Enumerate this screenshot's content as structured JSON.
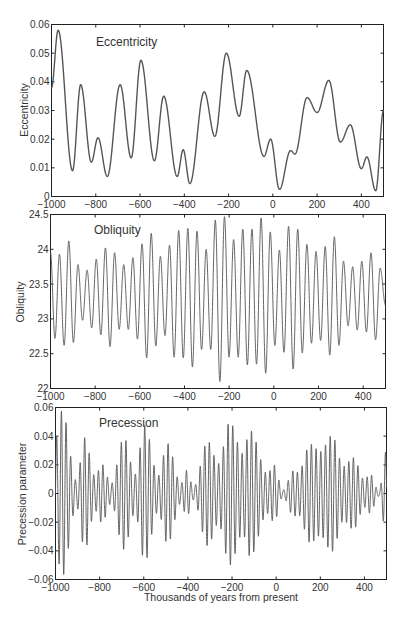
{
  "figure": {
    "xlabel": "Thousands of years from present",
    "caption_fragment": ""
  },
  "chart_data": [
    {
      "type": "line",
      "title": "Eccentricity",
      "xlabel": "",
      "ylabel": "Eccentricity",
      "xlim": [
        -1000,
        500
      ],
      "ylim": [
        0,
        0.06
      ],
      "xticks": [
        -1000,
        -800,
        -600,
        -400,
        -200,
        0,
        200,
        400
      ],
      "xtick_labels": [
        "-1000",
        "-800",
        "-600",
        "-400",
        "-200",
        "0",
        "200",
        "400"
      ],
      "yticks": [
        0,
        0.01,
        0.02,
        0.03,
        0.04,
        0.05,
        0.06
      ],
      "ytick_labels": [
        "0",
        "0.01",
        "0.02",
        "0.03",
        "0.04",
        "0.05",
        "0.06"
      ],
      "grid": false,
      "x": [
        -1000,
        -970,
        -905,
        -868,
        -820,
        -790,
        -748,
        -690,
        -640,
        -596,
        -535,
        -493,
        -432,
        -405,
        -375,
        -310,
        -262,
        -210,
        -152,
        -118,
        -40,
        -10,
        30,
        80,
        100,
        155,
        200,
        253,
        305,
        350,
        400,
        425,
        465,
        500
      ],
      "values": [
        0.038,
        0.058,
        0.009,
        0.039,
        0.012,
        0.0205,
        0.007,
        0.039,
        0.0135,
        0.0475,
        0.0125,
        0.035,
        0.007,
        0.0163,
        0.0045,
        0.0365,
        0.021,
        0.05,
        0.028,
        0.044,
        0.014,
        0.02,
        0.0025,
        0.016,
        0.0148,
        0.0345,
        0.0293,
        0.0405,
        0.019,
        0.025,
        0.0097,
        0.0138,
        0.002,
        0.03
      ]
    },
    {
      "type": "line",
      "title": "Obliquity",
      "xlabel": "",
      "ylabel": "Obliquity",
      "xlim": [
        -1000,
        500
      ],
      "ylim": [
        22,
        24.5
      ],
      "xticks": [
        -1000,
        -800,
        -600,
        -400,
        -200,
        0,
        200,
        400
      ],
      "xtick_labels": [
        "-1000",
        "-800",
        "-600",
        "-400",
        "-200",
        "0",
        "200",
        "400"
      ],
      "yticks": [
        22,
        22.5,
        23,
        23.5,
        24,
        24.5
      ],
      "ytick_labels": [
        "22",
        "22.5",
        "23",
        "23.5",
        "24",
        "24.5"
      ],
      "grid": false,
      "period_kyr": 41,
      "peaks_x": [
        -1000,
        -960,
        -918,
        -877,
        -836,
        -795,
        -754,
        -713,
        -672,
        -631,
        -590,
        -549,
        -508,
        -467,
        -426,
        -385,
        -344,
        -303,
        -262,
        -221,
        -180,
        -139,
        -98,
        -57,
        -16,
        25,
        66,
        107,
        148,
        189,
        230,
        271,
        312,
        353,
        394,
        435,
        476
      ],
      "peaks": [
        23.95,
        23.93,
        24.12,
        23.78,
        23.7,
        23.86,
        24.02,
        23.95,
        23.78,
        23.88,
        24.08,
        24.23,
        23.9,
        24.06,
        24.27,
        24.3,
        24.26,
        24.0,
        24.42,
        24.47,
        24.14,
        24.29,
        24.29,
        24.45,
        24.25,
        23.99,
        24.33,
        24.29,
        24.07,
        23.97,
        24.04,
        24.18,
        23.83,
        23.75,
        23.83,
        23.95,
        23.73
      ],
      "troughs": [
        22.72,
        22.62,
        22.66,
        22.98,
        22.87,
        22.77,
        22.6,
        22.85,
        22.85,
        22.71,
        22.44,
        22.61,
        22.76,
        22.45,
        22.44,
        22.31,
        22.56,
        22.56,
        22.1,
        22.45,
        22.45,
        22.34,
        22.35,
        22.22,
        22.62,
        22.52,
        22.28,
        22.51,
        22.65,
        22.69,
        22.48,
        22.62,
        22.9,
        22.84,
        22.81,
        22.7
      ]
    },
    {
      "type": "line",
      "title": "Precession",
      "xlabel": "Thousands of years from present",
      "ylabel": "Precession parameter",
      "xlim": [
        -1000,
        500
      ],
      "ylim": [
        -0.06,
        0.06
      ],
      "xticks": [
        -1000,
        -800,
        -600,
        -400,
        -200,
        0,
        200,
        400
      ],
      "xtick_labels": [
        "-1000",
        "-800",
        "-600",
        "-400",
        "-200",
        "0",
        "200",
        "400"
      ],
      "yticks": [
        -0.06,
        -0.04,
        -0.02,
        0,
        0.02,
        0.04,
        0.06
      ],
      "ytick_labels": [
        "-0.06",
        "-0.04",
        "-0.02",
        "0",
        "0.02",
        "0.04",
        "0.06"
      ],
      "grid": false,
      "period_kyr": 21,
      "note": "Oscillation amplitude envelope follows eccentricity",
      "envelope_x": [
        -1000,
        -970,
        -905,
        -868,
        -820,
        -790,
        -748,
        -690,
        -640,
        -596,
        -535,
        -493,
        -432,
        -405,
        -375,
        -310,
        -262,
        -210,
        -152,
        -118,
        -40,
        -10,
        30,
        80,
        100,
        155,
        200,
        253,
        305,
        350,
        400,
        425,
        465,
        500
      ],
      "envelope": [
        0.038,
        0.058,
        0.009,
        0.039,
        0.012,
        0.0205,
        0.007,
        0.039,
        0.0135,
        0.0475,
        0.0125,
        0.035,
        0.007,
        0.0163,
        0.0045,
        0.0365,
        0.021,
        0.05,
        0.028,
        0.044,
        0.014,
        0.02,
        0.0025,
        0.016,
        0.0148,
        0.0345,
        0.0293,
        0.0405,
        0.019,
        0.025,
        0.0097,
        0.0138,
        0.002,
        0.03
      ]
    }
  ],
  "panels": [
    {
      "title": "Eccentricity",
      "ylabel": "Eccentricity"
    },
    {
      "title": "Obliquity",
      "ylabel": "Obliquity"
    },
    {
      "title": "Precession",
      "ylabel": "Precession parameter"
    }
  ]
}
